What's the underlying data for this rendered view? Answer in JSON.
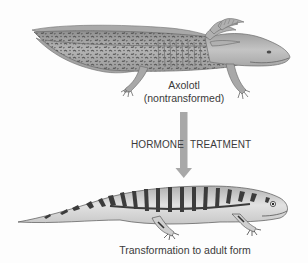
{
  "figure": {
    "top_specimen": {
      "name_label": "Axolotl",
      "state_label": "(nontransformed)"
    },
    "process": {
      "left_label": "HORMONE",
      "right_label": "TREATMENT",
      "arrow_direction": "down",
      "arrow_color": "#a8a8a8"
    },
    "bottom_specimen": {
      "caption": "Transformation to adult form"
    },
    "colors": {
      "background": "#fdfdfd",
      "axolotl_body": "#b9b9b9",
      "axolotl_spots": "#5c5c5c",
      "adult_body": "#d6d6d6",
      "adult_stripes": "#3c3c3c",
      "text": "#3a3a3a"
    }
  }
}
